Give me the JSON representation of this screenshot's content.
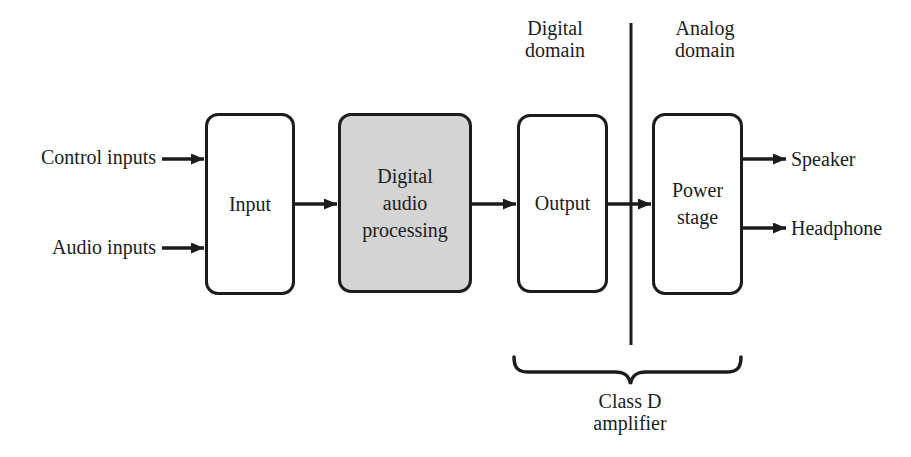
{
  "diagram": {
    "colors": {
      "background": "#ffffff",
      "line": "#1c1c1c",
      "block_fill": "#ffffff",
      "shaded_block_fill": "#d4d4d4",
      "text": "#1c1c1c"
    },
    "domains": {
      "digital": "Digital\ndomain",
      "analog": "Analog\ndomain"
    },
    "inputs": {
      "control": "Control inputs",
      "audio": "Audio inputs"
    },
    "blocks": {
      "input": "Input",
      "processing": "Digital\naudio\nprocessing",
      "output": "Output",
      "power": "Power\nstage"
    },
    "outputs": {
      "speaker": "Speaker",
      "headphone": "Headphone"
    },
    "brace_label": "Class D\namplifier"
  }
}
